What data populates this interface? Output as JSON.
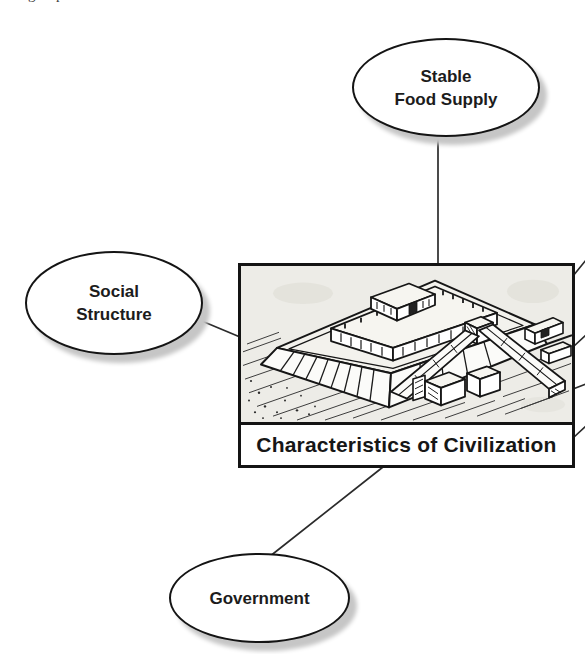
{
  "page": {
    "background_color": "#ffffff",
    "cropped_text_fragment": {
      "left_glyph": "g",
      "right_glyph": "p"
    }
  },
  "diagram": {
    "title_node": {
      "caption": "Characteristics of Civilization",
      "illustration": "hand-drawn ziggurat (stepped temple with ramps)"
    },
    "nodes": {
      "stable_food_supply": {
        "line1": "Stable",
        "line2": "Food Supply"
      },
      "social_structure": {
        "line1": "Social",
        "line2": "Structure"
      },
      "government": {
        "line1": "Government"
      }
    },
    "connectors": [
      "stable-food-supply to center",
      "social-structure to center",
      "government to center",
      "center to off-screen node (right, 1)",
      "center to off-screen node (right, 2)",
      "center to off-screen node (right, 3)",
      "center to off-screen node (right, 4)"
    ],
    "colors": {
      "node_fill": "#ffffff",
      "node_border": "#141414",
      "node_shadow": "#c6c6c6",
      "connector_line": "#2b2b2b",
      "text": "#1c1c1c",
      "illustration_paper": "#edece7"
    }
  }
}
